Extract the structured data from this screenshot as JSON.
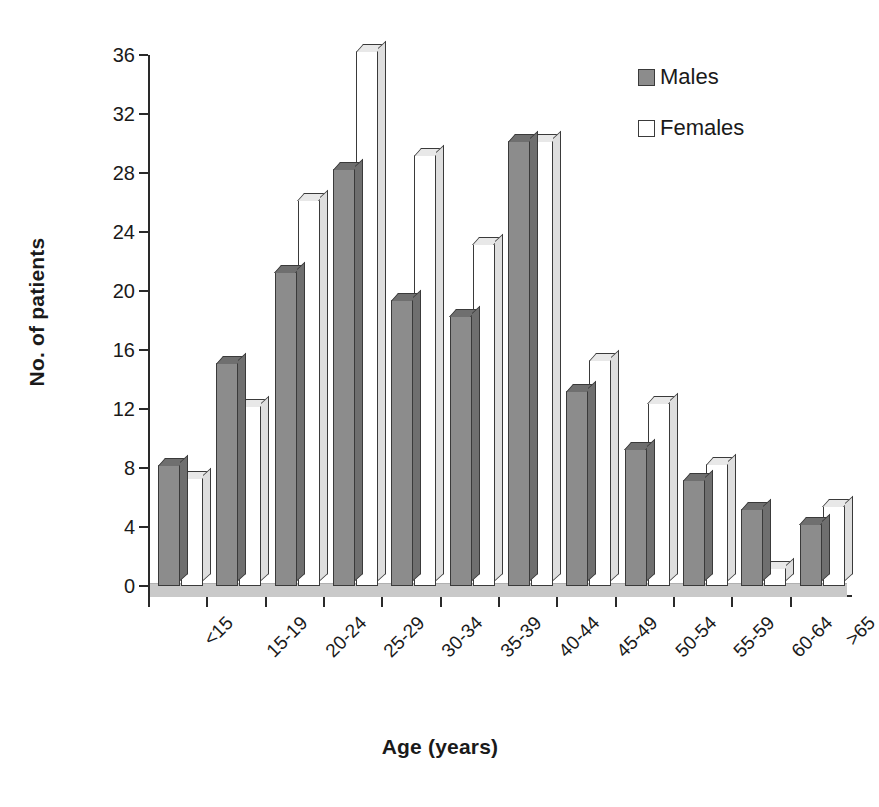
{
  "chart_data": {
    "type": "bar",
    "title": "",
    "xlabel": "Age (years)",
    "ylabel": "No. of patients",
    "categories": [
      "<15",
      "15-19",
      "20-24",
      "25-29",
      "30-34",
      "35-39",
      "40-44",
      "45-49",
      "50-54",
      "55-59",
      "60-64",
      ">65"
    ],
    "series": [
      {
        "name": "Males",
        "values": [
          8.2,
          15.1,
          21.3,
          28.3,
          19.4,
          18.3,
          30.2,
          13.2,
          9.3,
          7.2,
          5.2,
          4.2
        ]
      },
      {
        "name": "Females",
        "values": [
          7.3,
          12.2,
          26.2,
          36.3,
          29.2,
          23.2,
          30.2,
          15.3,
          12.4,
          8.3,
          1.2,
          5.4
        ]
      }
    ],
    "ylim": [
      0,
      36
    ],
    "yticks": [
      0,
      4,
      8,
      12,
      16,
      20,
      24,
      28,
      32,
      36
    ],
    "ytick_labels": [
      "0",
      "4",
      "8",
      "12",
      "16",
      "20",
      "24",
      "28",
      "32",
      "36"
    ],
    "grid": false,
    "legend_position": "top-right",
    "legend": [
      {
        "label": "Males",
        "swatch": "filled-gray-square",
        "color": "#8c8c8c"
      },
      {
        "label": "Females",
        "swatch": "empty-white-square",
        "color": "#ffffff"
      }
    ],
    "style": {
      "male_color": "#8c8c8c",
      "female_color": "#ffffff",
      "outline_color": "#3a3a3a",
      "axis_color": "#2a2a2a",
      "floor_color": "#c9c9c9",
      "background": "#ffffff"
    }
  }
}
